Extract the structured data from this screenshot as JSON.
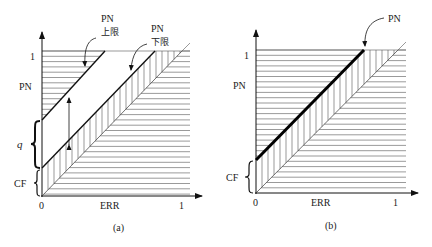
{
  "panels": [
    {
      "id": "a",
      "caption": "(a)",
      "x_axis": {
        "label": "ERR",
        "tick_start": "0",
        "tick_end": "1"
      },
      "y_axis": {
        "label": "PN",
        "tick_top": "1"
      },
      "brace_labels": {
        "q": "q",
        "cf": "CF"
      },
      "annotations": [
        {
          "line1": "PN",
          "line2": "上限"
        },
        {
          "line1": "PN",
          "line2": "下限"
        }
      ]
    },
    {
      "id": "b",
      "caption": "(b)",
      "x_axis": {
        "label": "ERR",
        "tick_start": "0",
        "tick_end": "1"
      },
      "y_axis": {
        "label": "PN",
        "tick_top": "1"
      },
      "brace_labels": {
        "cf": "CF"
      },
      "annotations": [
        {
          "line1": "PN"
        }
      ]
    }
  ]
}
